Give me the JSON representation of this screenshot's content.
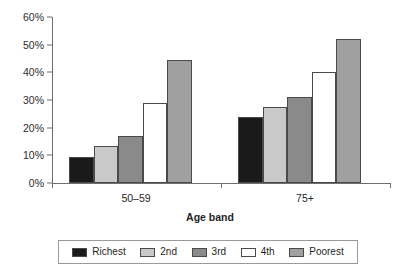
{
  "chart_data": {
    "type": "bar",
    "title": "",
    "subtitle": "",
    "xlabel": "Age band",
    "ylabel": "",
    "categories": [
      "50–59",
      "75+"
    ],
    "series": [
      {
        "name": "Richest",
        "values": [
          9.5,
          24
        ],
        "color": "#1a1a1a"
      },
      {
        "name": "2nd",
        "values": [
          13.5,
          27.5
        ],
        "color": "#c9c9c9"
      },
      {
        "name": "3rd",
        "values": [
          17,
          31
        ],
        "color": "#8a8a8a"
      },
      {
        "name": "4th",
        "values": [
          29,
          40
        ],
        "color": "#ffffff"
      },
      {
        "name": "Poorest",
        "values": [
          44.5,
          52
        ],
        "color": "#a0a0a0"
      }
    ],
    "ylim": [
      0,
      60
    ],
    "yticks": [
      0,
      10,
      20,
      30,
      40,
      50,
      60
    ],
    "ytick_labels": [
      "0%",
      "10%",
      "20%",
      "30%",
      "40%",
      "50%",
      "60%"
    ],
    "grid": false,
    "legend_position": "bottom",
    "legend_entries": [
      "Richest",
      "2nd",
      "3rd",
      "4th",
      "Poorest"
    ]
  },
  "axis": {
    "line_color": "#6e6e6e"
  }
}
